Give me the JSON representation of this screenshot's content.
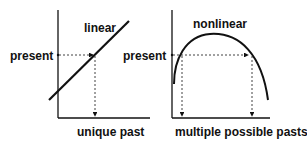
{
  "left_panel": {
    "curve_label": "linear",
    "y_label": "present",
    "x_label": "unique past"
  },
  "right_panel": {
    "curve_label": "nonlinear",
    "y_label": "present",
    "x_label": "multiple possible pasts"
  },
  "colors": {
    "ink": "#111111",
    "background": "#ffffff"
  }
}
